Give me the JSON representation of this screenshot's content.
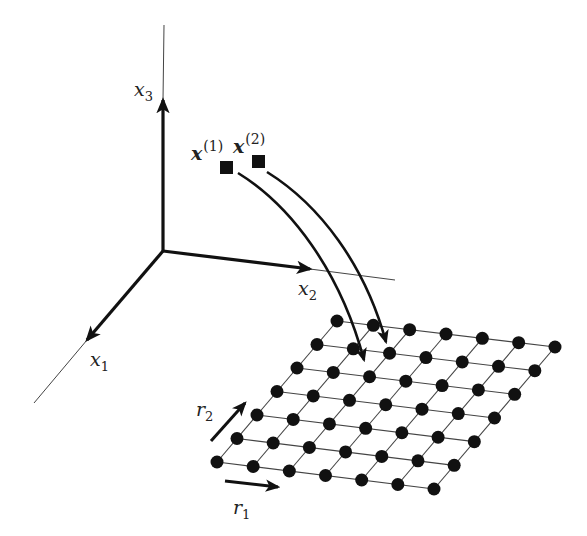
{
  "diagram": {
    "colors": {
      "ink": "#111111",
      "thin": "#444444",
      "background": "#ffffff"
    },
    "axes": {
      "origin": [
        163,
        251
      ],
      "x1": {
        "label": "x",
        "sub": "1",
        "arrow_tip": [
          87,
          340
        ],
        "line_end": [
          34,
          403
        ],
        "label_pos": [
          90,
          366
        ]
      },
      "x2": {
        "label": "x",
        "sub": "2",
        "arrow_tip": [
          310,
          269
        ],
        "line_end": [
          395,
          280
        ],
        "label_pos": [
          298,
          295
        ]
      },
      "x3": {
        "label": "x",
        "sub": "3",
        "arrow_tip": [
          163,
          100
        ],
        "line_end": [
          164,
          25
        ],
        "label_pos": [
          134,
          96
        ]
      }
    },
    "inputs": [
      {
        "label": "x",
        "sup": "(1)",
        "square": [
          220,
          161,
          13
        ],
        "label_pos": [
          191,
          160
        ],
        "curve": "M238,173 C290,205 340,270 364,360",
        "curve_tip": [
          364,
          363
        ]
      },
      {
        "label": "x",
        "sup": "(2)",
        "square": [
          252,
          155,
          13
        ],
        "label_pos": [
          233,
          153
        ],
        "curve": "M267,172 C320,205 365,265 386,342",
        "curve_tip": [
          386,
          346
        ]
      }
    ],
    "lattice": {
      "rows": 7,
      "cols": 7,
      "corners": {
        "top_left": [
          337,
          321
        ],
        "top_right": [
          555,
          347
        ],
        "bottom_left": [
          217,
          462
        ],
        "bottom_right": [
          434,
          489
        ]
      },
      "node_radius": 6.5
    },
    "lattice_axes": {
      "r1": {
        "label": "r",
        "sub": "1",
        "from": [
          225,
          481
        ],
        "to": [
          278,
          487
        ],
        "label_pos": [
          233,
          514
        ]
      },
      "r2": {
        "label": "r",
        "sub": "2",
        "from": [
          211,
          441
        ],
        "to": [
          245,
          403
        ],
        "label_pos": [
          196,
          416
        ]
      }
    }
  }
}
